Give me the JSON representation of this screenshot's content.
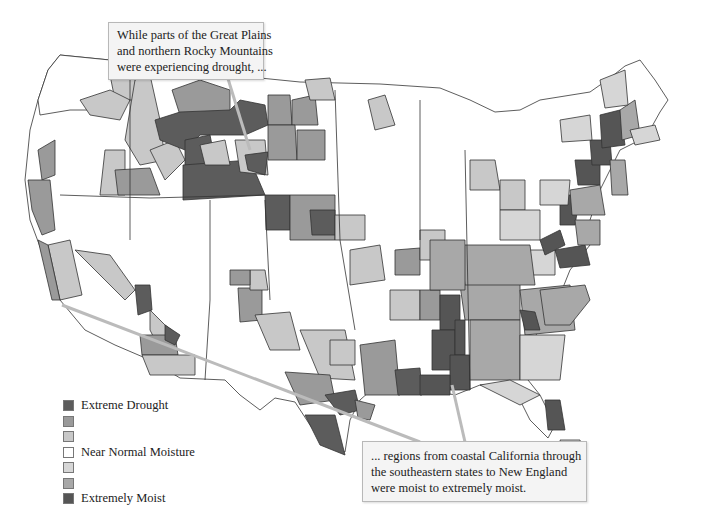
{
  "callouts": {
    "top": {
      "lines": [
        "While parts of the Great Plains",
        "and northern Rocky Mountains",
        "were experiencing drought, ..."
      ]
    },
    "bottom": {
      "lines": [
        "... regions from coastal California through",
        "the southeastern states to New England",
        "were moist to extremely moist."
      ]
    }
  },
  "legend": {
    "items": [
      {
        "label": "Extreme Drought",
        "color": "#5c5c5c"
      },
      {
        "label": "",
        "color": "#9a9a9a"
      },
      {
        "label": "",
        "color": "#c8c8c8"
      },
      {
        "label": "Near Normal Moisture",
        "color": "#ffffff"
      },
      {
        "label": "",
        "color": "#d6d6d6"
      },
      {
        "label": "",
        "color": "#a8a8a8"
      },
      {
        "label": "Extremely Moist",
        "color": "#555555"
      }
    ]
  },
  "colors": {
    "border": "#333333",
    "leader_line": "#bbbbbb"
  }
}
